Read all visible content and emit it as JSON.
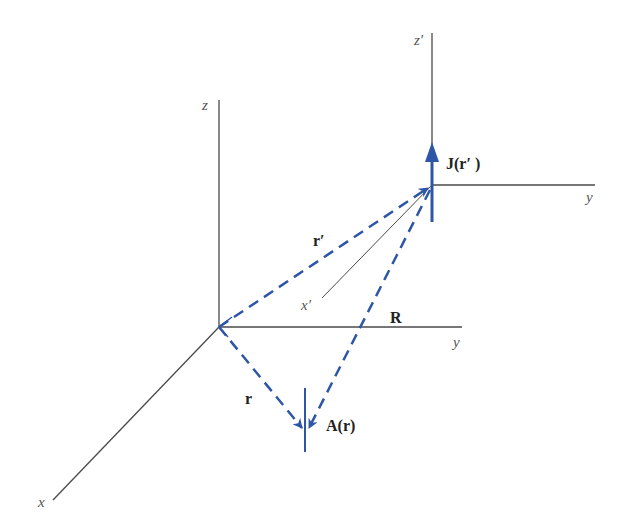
{
  "colors": {
    "axis": "#4a4a4a",
    "vector": "#2e56a6",
    "label": "#222222",
    "axis_label": "#555555"
  },
  "axes": {
    "origin_frame": {
      "z_label": "z",
      "y_label": "y",
      "x_label": "x"
    },
    "source_frame": {
      "z_label": "z′",
      "y_label": "y",
      "x_label": "x′"
    }
  },
  "vectors": {
    "r_prime": {
      "label": "r′",
      "style": "dashed"
    },
    "r": {
      "label": "r",
      "style": "dashed"
    },
    "R": {
      "label": "R",
      "style": "dashed"
    }
  },
  "quantities": {
    "current_density": {
      "label": "J(r′ )",
      "direction": "up"
    },
    "vector_potential": {
      "label": "A(r)",
      "direction": "down"
    }
  }
}
